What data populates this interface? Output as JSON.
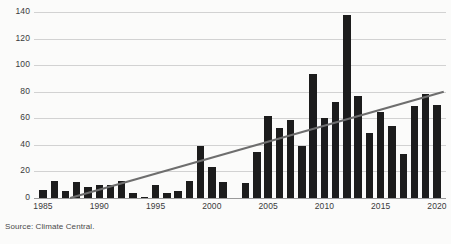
{
  "chart_data": {
    "type": "bar",
    "title": "",
    "subtitle": "",
    "xlabel": "",
    "ylabel": "",
    "xlim": [
      1984.2,
      2020.8
    ],
    "ylim": [
      0,
      140
    ],
    "yticks": [
      0,
      20,
      40,
      60,
      80,
      100,
      120,
      140
    ],
    "ytick_labels": [
      "0",
      "20",
      "40",
      "60",
      "80",
      "100",
      "120",
      "140"
    ],
    "xticks": [
      1985,
      1990,
      1995,
      2000,
      2005,
      2010,
      2015,
      2020
    ],
    "xtick_labels": [
      "1985",
      "1990",
      "1995",
      "2000",
      "2005",
      "2010",
      "2015",
      "2020"
    ],
    "grid": "horizontal",
    "legend": "none",
    "bar_color": "#1c1c1c",
    "grid_color": "#d2d2d2",
    "axis_color": "#9a9a9a",
    "categories": [
      "1985",
      "1986",
      "1987",
      "1988",
      "1989",
      "1990",
      "1991",
      "1992",
      "1993",
      "1994",
      "1995",
      "1996",
      "1997",
      "1998",
      "1999",
      "2000",
      "2001",
      "2002",
      "2003",
      "2004",
      "2005",
      "2006",
      "2007",
      "2008",
      "2009",
      "2010",
      "2011",
      "2012",
      "2013",
      "2014",
      "2015",
      "2016",
      "2017",
      "2018",
      "2019",
      "2020"
    ],
    "values": [
      6,
      13,
      5,
      12,
      8,
      10,
      10,
      13,
      4,
      1,
      10,
      4,
      5,
      13,
      39,
      23,
      12,
      0,
      11,
      35,
      62,
      53,
      59,
      39,
      93,
      60,
      72,
      138,
      77,
      49,
      65,
      54,
      33,
      69,
      78,
      70
    ],
    "series": [
      {
        "name": "annual count",
        "type": "bar",
        "color": "#1c1c1c",
        "values": [
          6,
          13,
          5,
          12,
          8,
          10,
          10,
          13,
          4,
          1,
          10,
          4,
          5,
          13,
          39,
          23,
          12,
          0,
          11,
          35,
          62,
          53,
          59,
          39,
          93,
          60,
          72,
          138,
          77,
          49,
          65,
          54,
          33,
          69,
          78,
          70
        ]
      },
      {
        "name": "trend line",
        "type": "line",
        "color": "#6e6e6e",
        "x": [
          1987.4,
          2020.6
        ],
        "y": [
          0,
          80
        ]
      }
    ],
    "annotations": []
  },
  "footer": {
    "source": "Source: Climate Central."
  }
}
